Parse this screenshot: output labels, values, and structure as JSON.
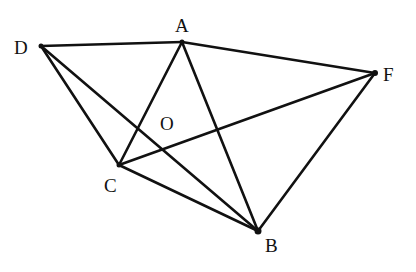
{
  "figure": {
    "type": "geometry-diagram",
    "stroke_color": "#111111",
    "background": "#ffffff",
    "points": {
      "D": {
        "label": "D",
        "x": 41,
        "y": 46
      },
      "A": {
        "label": "A",
        "x": 182,
        "y": 42
      },
      "F": {
        "label": "F",
        "x": 375,
        "y": 73
      },
      "C": {
        "label": "C",
        "x": 119,
        "y": 165
      },
      "B": {
        "label": "B",
        "x": 258,
        "y": 231
      },
      "O": {
        "label": "O"
      }
    },
    "segments": [
      [
        "D",
        "A"
      ],
      [
        "A",
        "F"
      ],
      [
        "D",
        "C"
      ],
      [
        "D",
        "B"
      ],
      [
        "A",
        "C"
      ],
      [
        "A",
        "B"
      ],
      [
        "C",
        "B"
      ],
      [
        "C",
        "F"
      ],
      [
        "F",
        "B"
      ]
    ]
  }
}
